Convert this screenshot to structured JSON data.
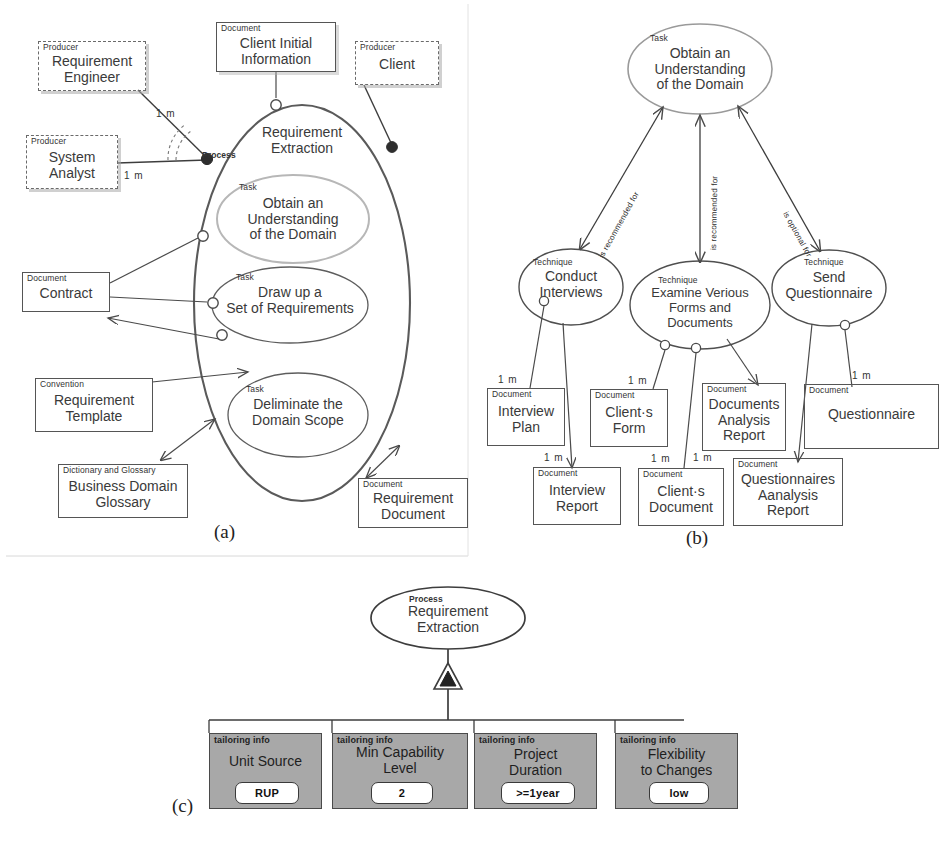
{
  "figure": {
    "panels": [
      {
        "id": "a",
        "letter": "(a)"
      },
      {
        "id": "b",
        "letter": "(b)"
      },
      {
        "id": "c",
        "letter": "(c)"
      }
    ]
  },
  "panel_a": {
    "nodes": [
      {
        "key": "client_initial_information",
        "stereotype": "Document",
        "name": "Client Initial\nInformation",
        "shape": "box"
      },
      {
        "key": "requirement_engineer",
        "stereotype": "Producer",
        "name": "Requirement\nEngineer",
        "shape": "box-dashed"
      },
      {
        "key": "client",
        "stereotype": "Producer",
        "name": "Client",
        "shape": "box-dashed"
      },
      {
        "key": "system_analyst",
        "stereotype": "Producer",
        "name": "System\nAnalyst",
        "shape": "box-dashed"
      },
      {
        "key": "requirement_extraction",
        "stereotype": "Process",
        "name": "Requirement\nExtraction",
        "shape": "ellipse"
      },
      {
        "key": "obtain_understanding",
        "stereotype": "Task",
        "name": "Obtain an\nUnderstanding\nof the Domain",
        "shape": "ellipse"
      },
      {
        "key": "draw_up_requirements",
        "stereotype": "Task",
        "name": "Draw up a\nSet of Requirements",
        "shape": "ellipse"
      },
      {
        "key": "deliminate_domain_scope",
        "stereotype": "Task",
        "name": "Deliminate the\nDomain Scope",
        "shape": "ellipse"
      },
      {
        "key": "contract",
        "stereotype": "Document",
        "name": "Contract",
        "shape": "box"
      },
      {
        "key": "requirement_template",
        "stereotype": "Convention",
        "name": "Requirement\nTemplate",
        "shape": "box"
      },
      {
        "key": "business_domain_glossary",
        "stereotype": "Dictionary and Glossary",
        "name": "Business Domain\nGlossary",
        "shape": "box"
      },
      {
        "key": "requirement_document",
        "stereotype": "Document",
        "name": "Requirement\nDocument",
        "shape": "box"
      }
    ],
    "multiplicities": [
      {
        "key": "re_mult",
        "text": "1 m"
      },
      {
        "key": "sa_mult",
        "text": "1 m"
      }
    ]
  },
  "panel_b": {
    "nodes": [
      {
        "key": "obtain_understanding",
        "stereotype": "Task",
        "name": "Obtain an\nUnderstanding\nof the Domain",
        "shape": "ellipse"
      },
      {
        "key": "conduct_interviews",
        "stereotype": "Technique",
        "name": "Conduct\nInterviews",
        "shape": "ellipse"
      },
      {
        "key": "examine_various_forms",
        "stereotype": "Technique",
        "name": "Examine Verious\nForms and\nDocuments",
        "shape": "ellipse"
      },
      {
        "key": "send_questionnaire",
        "stereotype": "Technique",
        "name": "Send\nQuestionnaire",
        "shape": "ellipse"
      },
      {
        "key": "interview_plan",
        "stereotype": "Document",
        "name": "Interview\nPlan",
        "shape": "box"
      },
      {
        "key": "clients_form",
        "stereotype": "Document",
        "name": "Client·s\nForm",
        "shape": "box"
      },
      {
        "key": "documents_analysis_report",
        "stereotype": "Document",
        "name": "Documents\nAnalysis\nReport",
        "shape": "box"
      },
      {
        "key": "questionnaire",
        "stereotype": "Document",
        "name": "Questionnaire",
        "shape": "box"
      },
      {
        "key": "interview_report",
        "stereotype": "Document",
        "name": "Interview\nReport",
        "shape": "box"
      },
      {
        "key": "clients_document",
        "stereotype": "Document",
        "name": "Client·s\nDocument",
        "shape": "box"
      },
      {
        "key": "questionnaires_analysis_report",
        "stereotype": "Document",
        "name": "Questionnaires\nAanalysis\nReport",
        "shape": "box"
      }
    ],
    "edge_labels": [
      {
        "key": "e1",
        "text": "is recommended for"
      },
      {
        "key": "e2",
        "text": "is recommended for"
      },
      {
        "key": "e3",
        "text": "is optional for"
      }
    ],
    "multiplicities": [
      {
        "key": "m1",
        "text": "1 m"
      },
      {
        "key": "m2",
        "text": "1 m"
      },
      {
        "key": "m3",
        "text": "1 m"
      },
      {
        "key": "m4",
        "text": "1 m"
      },
      {
        "key": "m5",
        "text": "1 m"
      },
      {
        "key": "m6",
        "text": "1 m"
      }
    ]
  },
  "panel_c": {
    "root": {
      "stereotype": "Process",
      "name": "Requirement\nExtraction"
    },
    "tailoring_label": "tailoring info",
    "items": [
      {
        "key": "unit_source",
        "stereotype": "tailoring info",
        "name": "Unit Source",
        "value": "RUP"
      },
      {
        "key": "min_capability_level",
        "stereotype": "tailoring info",
        "name": "Min Capability\nLevel",
        "value": "2"
      },
      {
        "key": "project_duration",
        "stereotype": "tailoring info",
        "name": "Project\nDuration",
        "value": ">=1year"
      },
      {
        "key": "flexibility_to_changes",
        "stereotype": "tailoring info",
        "name": "Flexibility\nto Changes",
        "value": "low"
      }
    ]
  },
  "colors": {
    "stroke": "#555555",
    "text": "#3a3a3a",
    "tailoring_fill": "#a8a8a8",
    "value_fill": "#ffffff"
  }
}
